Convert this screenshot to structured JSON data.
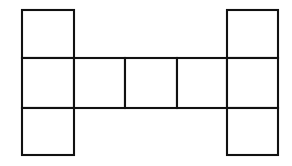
{
  "figure": {
    "kind": "geometric-diagram",
    "name": "cube-net",
    "background_color": "#ffffff",
    "line_color": "#111111",
    "fill_color": "#ffffff",
    "line_width_px": 2,
    "canvas": {
      "width": 292,
      "height": 166
    },
    "grid": {
      "columns": 5,
      "rows": 3,
      "x_boundaries": [
        22,
        74,
        125,
        177,
        227,
        278
      ],
      "y_boundaries": [
        10,
        58,
        108,
        155
      ],
      "cell_width_px": 51,
      "cell_height_px": 49
    },
    "occupancy": [
      [
        1,
        0,
        0,
        0,
        1
      ],
      [
        1,
        1,
        1,
        1,
        1
      ],
      [
        1,
        0,
        0,
        0,
        1
      ]
    ],
    "square_count": 9,
    "squares": [
      {
        "id": "square-r1c1",
        "row": 1,
        "col": 1,
        "x": 22,
        "y": 10,
        "width": 52,
        "height": 48
      },
      {
        "id": "square-r1c5",
        "row": 1,
        "col": 5,
        "x": 227,
        "y": 10,
        "width": 51,
        "height": 48
      },
      {
        "id": "square-r2c1",
        "row": 2,
        "col": 1,
        "x": 22,
        "y": 58,
        "width": 52,
        "height": 50
      },
      {
        "id": "square-r2c2",
        "row": 2,
        "col": 2,
        "x": 74,
        "y": 58,
        "width": 51,
        "height": 50
      },
      {
        "id": "square-r2c3",
        "row": 2,
        "col": 3,
        "x": 125,
        "y": 58,
        "width": 52,
        "height": 50
      },
      {
        "id": "square-r2c4",
        "row": 2,
        "col": 4,
        "x": 177,
        "y": 58,
        "width": 50,
        "height": 50
      },
      {
        "id": "square-r2c5",
        "row": 2,
        "col": 5,
        "x": 227,
        "y": 58,
        "width": 51,
        "height": 50
      },
      {
        "id": "square-r3c1",
        "row": 3,
        "col": 1,
        "x": 22,
        "y": 108,
        "width": 52,
        "height": 47
      },
      {
        "id": "square-r3c5",
        "row": 3,
        "col": 5,
        "x": 227,
        "y": 108,
        "width": 51,
        "height": 47
      }
    ]
  }
}
